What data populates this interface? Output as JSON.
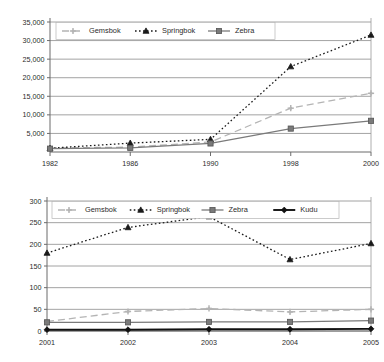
{
  "chart_data": [
    {
      "id": "top",
      "type": "line",
      "title": "",
      "xlabel": "",
      "ylabel": "",
      "x": [
        1982,
        1986,
        1990,
        1998,
        2000
      ],
      "categories": [
        "1982",
        "1986",
        "1990",
        "1998",
        "2000"
      ],
      "xtick_labels": [
        "1982",
        "1986",
        "1990",
        "1998",
        "2000"
      ],
      "ytick_labels": [
        "5,000",
        "10,000",
        "15,000",
        "20,000",
        "25,000",
        "30,000",
        "35,000"
      ],
      "yticks": [
        5000,
        10000,
        15000,
        20000,
        25000,
        30000,
        35000
      ],
      "ylim": [
        0,
        35000
      ],
      "xlim": [
        1982,
        2000
      ],
      "grid": "horizontal",
      "legend_position": "top-left-inside",
      "series": [
        {
          "name": "Gemsbok",
          "values": [
            1100,
            1300,
            2700,
            11800,
            15800
          ],
          "color": "#b4b4b4",
          "dash": "7,4",
          "marker": "cross"
        },
        {
          "name": "Springbok",
          "values": [
            1000,
            2400,
            3400,
            23000,
            31500
          ],
          "color": "#1a1a1a",
          "dash": "1.6,2.4",
          "marker": "triangle"
        },
        {
          "name": "Zebra",
          "values": [
            900,
            1100,
            2300,
            6300,
            8400
          ],
          "color": "#7a7a7a",
          "dash": "none",
          "marker": "square"
        }
      ]
    },
    {
      "id": "bottom",
      "type": "line",
      "title": "",
      "xlabel": "",
      "ylabel": "",
      "x": [
        2001,
        2002,
        2003,
        2004,
        2005
      ],
      "categories": [
        "2001",
        "2002",
        "2003",
        "2004",
        "2005"
      ],
      "xtick_labels": [
        "2001",
        "2002",
        "2003",
        "2004",
        "2005"
      ],
      "ytick_labels": [
        "0",
        "50",
        "100",
        "150",
        "200",
        "250",
        "300"
      ],
      "yticks": [
        0,
        50,
        100,
        150,
        200,
        250,
        300
      ],
      "ylim": [
        0,
        300
      ],
      "xlim": [
        2001,
        2005
      ],
      "grid": "horizontal",
      "legend_position": "top-left-inside",
      "series": [
        {
          "name": "Gemsbok",
          "values": [
            22,
            45,
            52,
            44,
            50
          ],
          "color": "#b4b4b4",
          "dash": "7,4",
          "marker": "cross"
        },
        {
          "name": "Springbok",
          "values": [
            180,
            239,
            264,
            165,
            202
          ],
          "color": "#1a1a1a",
          "dash": "1.6,2.4",
          "marker": "triangle"
        },
        {
          "name": "Zebra",
          "values": [
            20,
            20,
            21,
            21,
            24
          ],
          "color": "#7a7a7a",
          "dash": "none",
          "marker": "square"
        },
        {
          "name": "Kudu",
          "values": [
            3,
            3,
            4,
            4,
            5
          ],
          "color": "#111111",
          "dash": "none",
          "marker": "diamond"
        }
      ]
    }
  ]
}
